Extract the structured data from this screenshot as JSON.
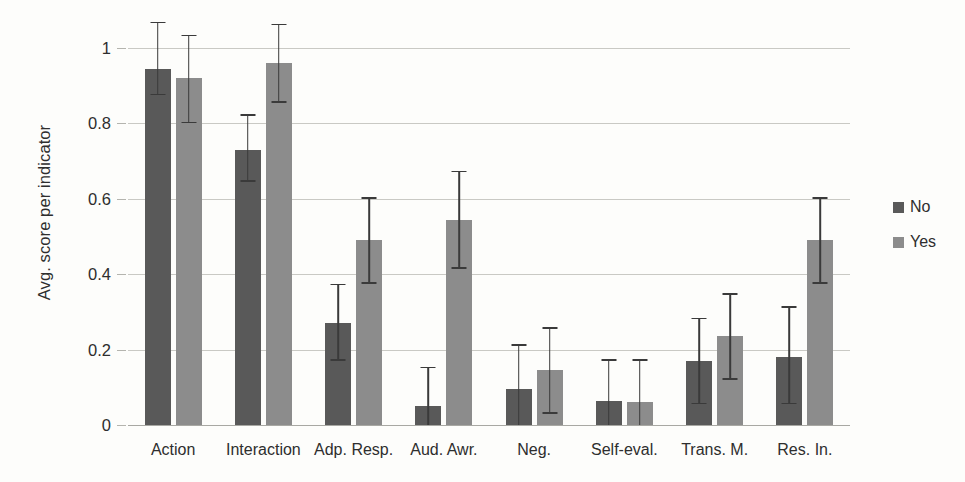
{
  "chart_data": {
    "type": "bar",
    "title": "",
    "xlabel": "",
    "ylabel": "Avg. score per indicator",
    "ylim": [
      0,
      1
    ],
    "yticks": [
      0,
      0.2,
      0.4,
      0.6,
      0.8,
      1
    ],
    "ytick_labels": [
      "0",
      "0.2",
      "0.4",
      "0.6",
      "0.8",
      "1"
    ],
    "grid": true,
    "legend_position": "right",
    "categories": [
      "Action",
      "Interaction",
      "Adp. Resp.",
      "Aud. Awr.",
      "Neg.",
      "Self-eval.",
      "Trans. M.",
      "Res. In."
    ],
    "series": [
      {
        "name": "No",
        "color": "#595959",
        "values": [
          0.945,
          0.73,
          0.27,
          0.05,
          0.095,
          0.065,
          0.17,
          0.18
        ],
        "err_low": [
          0.875,
          0.645,
          0.17,
          0.0,
          0.0,
          0.0,
          0.055,
          0.055
        ],
        "err_high": [
          1.07,
          0.825,
          0.375,
          0.155,
          0.215,
          0.175,
          0.285,
          0.315
        ]
      },
      {
        "name": "Yes",
        "color": "#8c8c8c",
        "values": [
          0.92,
          0.96,
          0.49,
          0.545,
          0.145,
          0.06,
          0.235,
          0.49
        ],
        "err_low": [
          0.8,
          0.855,
          0.375,
          0.415,
          0.03,
          0.0,
          0.12,
          0.375
        ],
        "err_high": [
          1.035,
          1.065,
          0.605,
          0.675,
          0.26,
          0.175,
          0.35,
          0.605
        ]
      }
    ]
  },
  "legend": {
    "items": [
      {
        "label": "No",
        "color": "#595959"
      },
      {
        "label": "Yes",
        "color": "#8c8c8c"
      }
    ]
  }
}
